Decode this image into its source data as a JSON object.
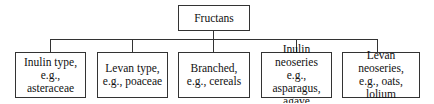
{
  "diagram": {
    "type": "tree",
    "root": {
      "label": "Fructans"
    },
    "children": [
      {
        "label": "Inulin type,\ne.g., asteraceae"
      },
      {
        "label": "Levan type,\ne.g., poaceae"
      },
      {
        "label": "Branched,\ne.g., cereals"
      },
      {
        "label": "Inulin neoseries\ne.g., asparagus,\nagave"
      },
      {
        "label": "Levan neoseries,\ne.g., oats, lolium"
      }
    ]
  }
}
